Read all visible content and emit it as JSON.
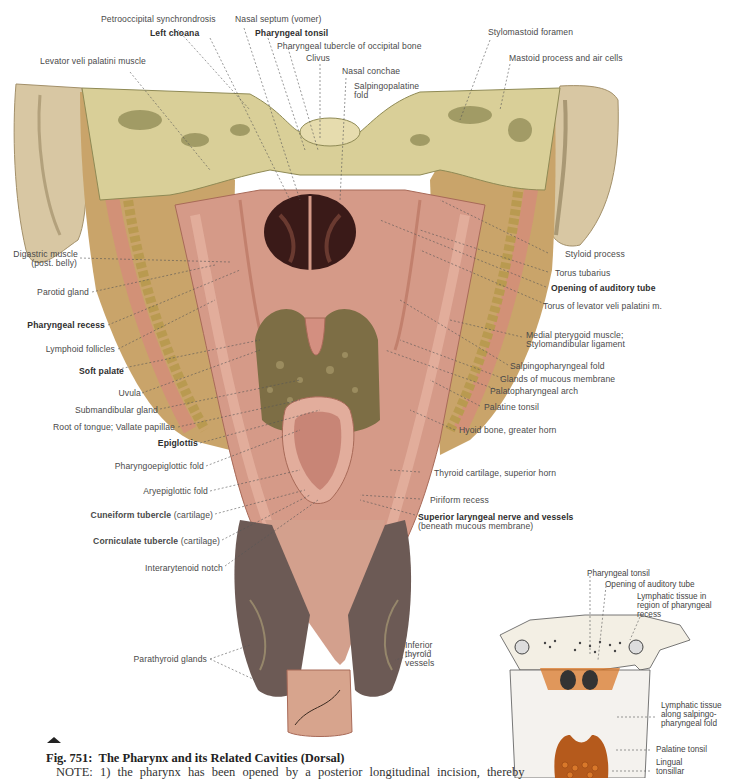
{
  "figure": {
    "number": "Fig. 751:",
    "title": "The Pharynx and its Related Cavities (Dorsal)",
    "note": "NOTE: 1) the pharynx has been opened by a posterior longitudinal incision, thereby",
    "marker_icon": "triangle-up-icon"
  },
  "labels_top": [
    {
      "text": "Petrooccipital synchrondrosis",
      "bold": false
    },
    {
      "text": "Nasal septum (vomer)",
      "bold": false
    },
    {
      "text": "Left choana",
      "bold": true
    },
    {
      "text": "Pharyngeal tonsil",
      "bold": true
    },
    {
      "text": "Pharyngeal tubercle of occipital bone",
      "bold": false
    },
    {
      "text": "Clivus",
      "bold": false
    },
    {
      "text": "Nasal conchae",
      "bold": false
    },
    {
      "text": "Salpingopalatine",
      "bold": false
    },
    {
      "text": "fold",
      "bold": false
    },
    {
      "text": "Levator veli palatini muscle",
      "bold": false
    },
    {
      "text": "Stylomastoid foramen",
      "bold": false
    },
    {
      "text": "Mastoid process and air cells",
      "bold": false
    }
  ],
  "labels_left": [
    {
      "text": "Digastric muscle",
      "bold": false
    },
    {
      "text": "(post. belly)",
      "bold": false
    },
    {
      "text": "Parotid gland",
      "bold": false
    },
    {
      "text": "Pharyngeal recess",
      "bold": true
    },
    {
      "text": "Lymphoid follicles",
      "bold": false
    },
    {
      "text": "Soft palate",
      "bold": true
    },
    {
      "text": "Uvula",
      "bold": false
    },
    {
      "text": "Submandibular gland",
      "bold": false
    },
    {
      "text": "Root of tongue; Vallate papillae",
      "bold": false
    },
    {
      "text": "Epiglottis",
      "bold": true
    },
    {
      "text": "Pharyngoepiglottic fold",
      "bold": false
    },
    {
      "text": "Aryepiglottic fold",
      "bold": false
    },
    {
      "text": "Cuneiform tubercle",
      "bold": true,
      "suffix": " (cartilage)"
    },
    {
      "text": "Corniculate tubercle",
      "bold": true,
      "suffix": " (cartilage)"
    },
    {
      "text": "Interarytenoid notch",
      "bold": false
    },
    {
      "text": "Parathyroid glands",
      "bold": false
    }
  ],
  "labels_right": [
    {
      "text": "Styloid process",
      "bold": false
    },
    {
      "text": "Torus tubarius",
      "bold": false
    },
    {
      "text": "Opening of auditory tube",
      "bold": true
    },
    {
      "text": "Torus of levator veli palatini m.",
      "bold": false
    },
    {
      "text": "Medial pterygoid muscle;",
      "bold": false
    },
    {
      "text": "Stylomandibular ligament",
      "bold": false
    },
    {
      "text": "Salpingopharyngeal fold",
      "bold": false
    },
    {
      "text": "Glands of mucous membrane",
      "bold": false
    },
    {
      "text": "Palatopharyngeal arch",
      "bold": false
    },
    {
      "text": "Palatine tonsil",
      "bold": false
    },
    {
      "text": "Hyoid bone, greater horn",
      "bold": false
    },
    {
      "text": "Thyroid cartilage, superior horn",
      "bold": false
    },
    {
      "text": "Piriform recess",
      "bold": false
    },
    {
      "text": "Superior laryngeal nerve and vessels",
      "bold": true
    },
    {
      "text": "(beneath mucous membrane)",
      "bold": false
    },
    {
      "text": "Inferior",
      "bold": false
    },
    {
      "text": "thyroid",
      "bold": false
    },
    {
      "text": "vessels",
      "bold": false
    }
  ],
  "inset": {
    "labels": [
      "Pharyngeal tonsil",
      "Opening of auditory tube",
      "Lymphatic tissue in",
      "region of pharyngeal",
      "recess",
      "Lymphatic tissue",
      "along salpingo-",
      "pharyngeal fold",
      "Palatine tonsil",
      "Lingual",
      "tonsillar"
    ]
  },
  "colors": {
    "bone": "#d9cf98",
    "bone_dark": "#8f8a55",
    "mucosa": "#d59a88",
    "mucosa_dark": "#b5705e",
    "cavity": "#3a1a18",
    "gland": "#b9a45e",
    "ear": "#d8c7a3",
    "thyroid": "#6c5a55",
    "lymph": "#d9782a"
  }
}
